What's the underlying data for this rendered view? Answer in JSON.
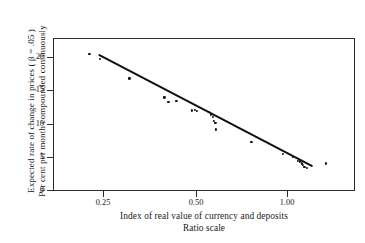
{
  "figure": {
    "background_color": "#ffffff",
    "frame_color": "#2b2b2b",
    "point_color": "#111111",
    "line_color": "#111111"
  },
  "chart_data": {
    "type": "scatter",
    "title": "",
    "subtitle": "",
    "xlabel": "Index of real value of currency and deposits",
    "xlabel_secondary": "Ratio scale",
    "ylabel": "Expected rate of change in prices ( β = .05 )",
    "ylabel_secondary": "Per cent per month compounded continuously",
    "xscale": "log",
    "yscale": "linear",
    "xlim": [
      0.185,
      1.28
    ],
    "ylim": [
      0,
      22.5
    ],
    "grid": false,
    "legend": null,
    "xticks": [
      0.25,
      0.5,
      1.0
    ],
    "xtick_labels": [
      "0.25",
      "0.50",
      "1.00"
    ],
    "yticks": [
      0,
      5,
      10,
      15,
      20
    ],
    "ytick_labels": [
      "0",
      "5",
      "10",
      "15",
      "20"
    ],
    "annotations": [],
    "points": [
      {
        "x": 0.232,
        "y": 20.3
      },
      {
        "x": 0.248,
        "y": 19.6
      },
      {
        "x": 0.3,
        "y": 16.7
      },
      {
        "x": 0.375,
        "y": 13.9
      },
      {
        "x": 0.385,
        "y": 13.3
      },
      {
        "x": 0.405,
        "y": 13.4
      },
      {
        "x": 0.447,
        "y": 12.0
      },
      {
        "x": 0.455,
        "y": 12.1
      },
      {
        "x": 0.462,
        "y": 11.9
      },
      {
        "x": 0.5,
        "y": 11.8
      },
      {
        "x": 0.505,
        "y": 11.3
      },
      {
        "x": 0.512,
        "y": 11.0
      },
      {
        "x": 0.516,
        "y": 10.4
      },
      {
        "x": 0.52,
        "y": 10.2
      },
      {
        "x": 0.523,
        "y": 9.2
      },
      {
        "x": 0.655,
        "y": 7.4
      },
      {
        "x": 0.8,
        "y": 5.6
      },
      {
        "x": 0.855,
        "y": 5.2
      },
      {
        "x": 0.88,
        "y": 4.6
      },
      {
        "x": 0.895,
        "y": 4.5
      },
      {
        "x": 0.905,
        "y": 4.2
      },
      {
        "x": 0.912,
        "y": 4.0
      },
      {
        "x": 0.92,
        "y": 3.7
      },
      {
        "x": 0.935,
        "y": 3.5
      },
      {
        "x": 1.055,
        "y": 4.2
      }
    ],
    "fit_line": {
      "label": "fitted regression line",
      "x_start": 0.248,
      "y_start": 20.1,
      "x_end": 0.975,
      "y_end": 3.6
    }
  },
  "axes": {
    "y_ticks": [
      {
        "label": "20",
        "value": 20
      },
      {
        "label": "15",
        "value": 15
      },
      {
        "label": "10",
        "value": 10
      },
      {
        "label": "5",
        "value": 5
      },
      {
        "label": "0",
        "value": 0
      }
    ],
    "x_ticks": [
      {
        "label": "0.25",
        "value": 0.25
      },
      {
        "label": "0.50",
        "value": 0.5
      },
      {
        "label": "1.00",
        "value": 1.0
      }
    ]
  }
}
